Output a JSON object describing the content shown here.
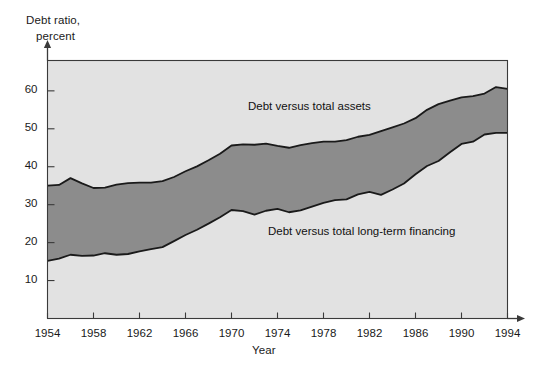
{
  "chart_data": {
    "type": "area",
    "title": "",
    "subtitle": "",
    "ylabel_line1": "Debt ratio,",
    "ylabel_line2": "percent",
    "xlabel": "Year",
    "xlim": [
      1954,
      1994
    ],
    "ylim": [
      0,
      68
    ],
    "grid": false,
    "legend_position": "inline-annotation",
    "xticks": [
      1954,
      1958,
      1962,
      1966,
      1970,
      1974,
      1978,
      1982,
      1986,
      1990,
      1994
    ],
    "xtick_labels": [
      "1954",
      "1958",
      "1962",
      "1966",
      "1970",
      "1974",
      "1978",
      "1982",
      "1986",
      "1990",
      "1994"
    ],
    "yticks": [
      10,
      20,
      30,
      40,
      50,
      60
    ],
    "ytick_labels": [
      "10",
      "20",
      "30",
      "40",
      "50",
      "60"
    ],
    "annotations": [
      {
        "text": "Debt versus total assets",
        "series": "upper"
      },
      {
        "text": "Debt versus total long-term financing",
        "series": "lower"
      }
    ],
    "colors": {
      "band_fill": "#8c8c8c",
      "plot_background": "#e2e2e2",
      "line": "#1a1a1a",
      "axis": "#3a3a3a",
      "text": "#1a1a1a",
      "figure_background": "#ffffff"
    },
    "x": [
      1954,
      1955,
      1956,
      1957,
      1958,
      1959,
      1960,
      1961,
      1962,
      1963,
      1964,
      1965,
      1966,
      1967,
      1968,
      1969,
      1970,
      1971,
      1972,
      1973,
      1974,
      1975,
      1976,
      1977,
      1978,
      1979,
      1980,
      1981,
      1982,
      1983,
      1984,
      1985,
      1986,
      1987,
      1988,
      1989,
      1990,
      1991,
      1992,
      1993,
      1994
    ],
    "series": [
      {
        "name": "Debt versus total assets",
        "values": [
          35.0,
          35.2,
          37.0,
          35.6,
          34.4,
          34.5,
          35.3,
          35.7,
          35.8,
          35.8,
          36.2,
          37.3,
          38.8,
          40.1,
          41.7,
          43.4,
          45.6,
          45.9,
          45.8,
          46.1,
          45.5,
          45.0,
          45.7,
          46.2,
          46.6,
          46.6,
          47.0,
          47.9,
          48.4,
          49.4,
          50.4,
          51.4,
          52.8,
          55.0,
          56.5,
          57.4,
          58.3,
          58.6,
          59.3,
          61.0,
          60.5
        ]
      },
      {
        "name": "Debt versus total long-term financing",
        "values": [
          15.2,
          15.8,
          16.8,
          16.5,
          16.6,
          17.2,
          16.8,
          17.0,
          17.7,
          18.3,
          18.8,
          20.4,
          22.0,
          23.4,
          25.0,
          26.7,
          28.6,
          28.3,
          27.4,
          28.4,
          28.9,
          28.0,
          28.5,
          29.5,
          30.5,
          31.2,
          31.4,
          32.7,
          33.4,
          32.6,
          34.0,
          35.6,
          38.0,
          40.2,
          41.5,
          43.8,
          46.0,
          46.6,
          48.5,
          48.9,
          48.9
        ]
      }
    ]
  }
}
